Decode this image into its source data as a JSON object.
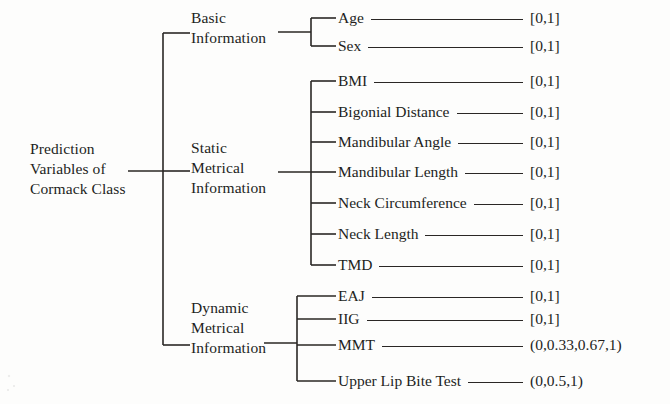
{
  "figure": {
    "type": "tree-diagram",
    "root": {
      "label": "Prediction\nVariables of\nCormack Class"
    },
    "categories": [
      {
        "id": "basic",
        "label": "Basic\nInformation"
      },
      {
        "id": "static",
        "label": "Static\nMetrical\nInformation"
      },
      {
        "id": "dynamic",
        "label": "Dynamic\nMetrical\nInformation"
      }
    ],
    "leaves": [
      {
        "group": "basic",
        "label": "Age",
        "value": "[0,1]"
      },
      {
        "group": "basic",
        "label": "Sex",
        "value": "[0,1]"
      },
      {
        "group": "static",
        "label": "BMI",
        "value": "[0,1]"
      },
      {
        "group": "static",
        "label": "Bigonial Distance",
        "value": "[0,1]"
      },
      {
        "group": "static",
        "label": "Mandibular  Angle",
        "value": "[0,1]"
      },
      {
        "group": "static",
        "label": "Mandibular Length",
        "value": "[0,1]"
      },
      {
        "group": "static",
        "label": "Neck Circumference",
        "value": "[0,1]"
      },
      {
        "group": "static",
        "label": "Neck Length",
        "value": "[0,1]"
      },
      {
        "group": "static",
        "label": "TMD",
        "value": "[0,1]"
      },
      {
        "group": "dynamic",
        "label": "EAJ",
        "value": "[0,1]"
      },
      {
        "group": "dynamic",
        "label": "IIG",
        "value": "[0,1]"
      },
      {
        "group": "dynamic",
        "label": "MMT",
        "value": "(0,0.33,0.67,1)"
      },
      {
        "group": "dynamic",
        "label": "Upper Lip Bite Test",
        "value": "(0,0.5,1)"
      }
    ],
    "colors": {
      "ink": "#231f1c",
      "line": "#2a2725",
      "background": "#fdfdfc"
    }
  }
}
